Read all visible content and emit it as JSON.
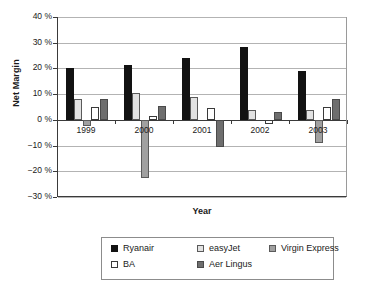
{
  "chart_data": {
    "type": "bar",
    "title": "",
    "xlabel": "Year",
    "ylabel": "Net Margin",
    "categories": [
      "1999",
      "2000",
      "2001",
      "2002",
      "2003"
    ],
    "series": [
      {
        "name": "Ryanair",
        "color": "#121212",
        "values": [
          20,
          21.5,
          24,
          28.5,
          19
        ]
      },
      {
        "name": "easyJet",
        "color": "#e2e2e2",
        "values": [
          8,
          10.5,
          9,
          4,
          4
        ]
      },
      {
        "name": "Virgin Express",
        "color": "#a0a0a0",
        "values": [
          -2.5,
          -22.5,
          null,
          null,
          -9
        ]
      },
      {
        "name": "BA",
        "color": "#ffffff",
        "values": [
          5,
          1.5,
          4.5,
          -1.5,
          5
        ]
      },
      {
        "name": "Aer Lingus",
        "color": "#6e6e6e",
        "values": [
          8,
          5.5,
          -10.5,
          3,
          8
        ]
      }
    ],
    "ylim": [
      -30,
      40
    ],
    "ytick_values": [
      40,
      30,
      20,
      10,
      0,
      -10,
      -20,
      -30
    ],
    "ytick_labels": [
      "40 %",
      "30 %",
      "20 %",
      "10 %",
      "0 %",
      "−10 %",
      "−20 %",
      "−30 %"
    ],
    "grid": "horizontal",
    "legend_position": "bottom",
    "value_unit": "percent"
  },
  "legend": {
    "rows": [
      [
        {
          "label": "Ryanair",
          "series": "ryanair"
        },
        {
          "label": "easyJet",
          "series": "easyjet"
        },
        {
          "label": "Virgin Express",
          "series": "virgin"
        }
      ],
      [
        {
          "label": "BA",
          "series": "ba"
        },
        {
          "label": "Aer Lingus",
          "series": "aerlingus"
        }
      ]
    ]
  }
}
